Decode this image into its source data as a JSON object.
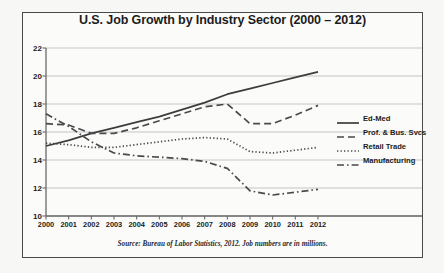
{
  "chart_data": {
    "type": "line",
    "title": "U.S. Job Growth by Industry Sector (2000 – 2012)",
    "xlabel": "",
    "ylabel": "",
    "xlim": [
      2000,
      2012
    ],
    "ylim": [
      10,
      22
    ],
    "ytick_step": 2,
    "grid": true,
    "legend_position": "right",
    "source_note": "Source: Bureau of Labor Statistics, 2012.  Job numbers are in millions.",
    "categories": [
      2000,
      2001,
      2002,
      2003,
      2004,
      2005,
      2006,
      2007,
      2008,
      2009,
      2010,
      2011,
      2012
    ],
    "xtick_labels": [
      "2000",
      "2001",
      "2002",
      "2003",
      "2004",
      "2005",
      "2006",
      "2007",
      "2008",
      "2009",
      "2010",
      "2011",
      "2012"
    ],
    "ytick_labels": [
      "10",
      "12",
      "14",
      "16",
      "18",
      "20",
      "22"
    ],
    "ytick_values": [
      10,
      12,
      14,
      16,
      18,
      20,
      22
    ],
    "series": [
      {
        "name": "Ed-Med",
        "style": "solid",
        "color": "#3d3d3d",
        "values": [
          15.0,
          15.4,
          15.9,
          16.3,
          16.7,
          17.1,
          17.6,
          18.1,
          18.7,
          19.1,
          19.5,
          19.9,
          20.3
        ]
      },
      {
        "name": "Prof. & Bus. Svcs",
        "style": "dashed",
        "color": "#4a4a4a",
        "values": [
          16.6,
          16.5,
          15.9,
          15.9,
          16.3,
          16.8,
          17.3,
          17.8,
          18.0,
          16.6,
          16.6,
          17.2,
          17.9
        ]
      },
      {
        "name": "Retail Trade",
        "style": "dotted",
        "color": "#4a4a4a",
        "values": [
          15.2,
          15.1,
          14.9,
          14.9,
          15.1,
          15.3,
          15.5,
          15.6,
          15.5,
          14.6,
          14.5,
          14.7,
          14.9
        ]
      },
      {
        "name": "Manufacturing",
        "style": "dashdot",
        "color": "#4a4a4a",
        "values": [
          17.3,
          16.4,
          15.3,
          14.5,
          14.3,
          14.2,
          14.1,
          13.9,
          13.4,
          11.8,
          11.5,
          11.7,
          11.9
        ]
      }
    ]
  }
}
